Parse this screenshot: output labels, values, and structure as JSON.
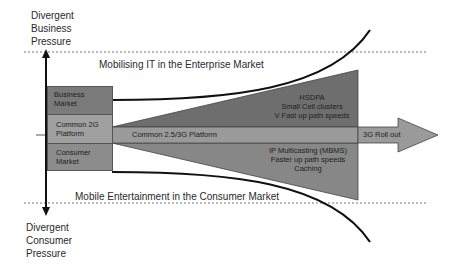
{
  "diagram": {
    "top_pressure": [
      "Divergent",
      "Business",
      "Pressure"
    ],
    "bottom_pressure": [
      "Divergent",
      "Consumer",
      "Pressure"
    ],
    "enterprise_title": "Mobilising IT in the Enterprise Market",
    "consumer_title": "Mobile Entertainment in the Consumer Market",
    "left_boxes": {
      "business": [
        "Business",
        "Market"
      ],
      "common2g": [
        "Common 2G",
        "Platform"
      ],
      "consumer": [
        "Consumer",
        "Market"
      ]
    },
    "platform_label": "Common 2.5/3G Platform",
    "rollout_label": "3G Roll out",
    "upper_wedge": [
      "HSDPA",
      "Small Cell clusters",
      "V Fast up path speeds"
    ],
    "lower_wedge": [
      "IP Multicasting (MBMS)",
      "Faster up path speeds",
      "Caching"
    ],
    "colors": {
      "dark_wedge": "#6e6e6e",
      "platform": "#9a9a9a",
      "business_box": "#7a7a7a",
      "common_box": "#a0a0a0",
      "consumer_box": "#8c8c8c",
      "curve": "#111111"
    }
  }
}
